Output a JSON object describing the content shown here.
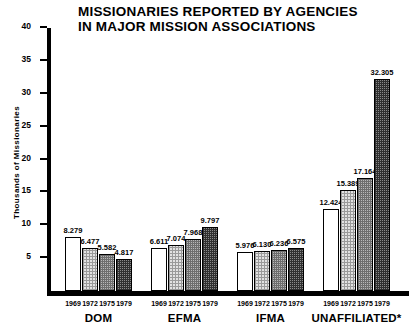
{
  "chart_data": {
    "type": "bar",
    "title": "MISSIONARIES REPORTED BY AGENCIES IN MAJOR MISSION ASSOCIATIONS",
    "title_line1": "MISSIONARIES REPORTED BY AGENCIES",
    "title_line2": "IN MAJOR MISSION ASSOCIATIONS",
    "xlabel": "",
    "ylabel": "Thousands of Missionaries",
    "ylim": [
      0,
      40
    ],
    "ytick_labels": [
      "40",
      "35",
      "30",
      "25",
      "20",
      "15",
      "10",
      "5"
    ],
    "ytick_values": [
      40,
      35,
      30,
      25,
      20,
      15,
      10,
      5
    ],
    "grid": false,
    "legend": "none",
    "categories": [
      "DOM",
      "EFMA",
      "IFMA",
      "UNAFFILIATED*"
    ],
    "x": [
      "1969",
      "1972",
      "1975",
      "1979"
    ],
    "series": [
      {
        "name": "1969",
        "fill": "white",
        "values": [
          8.279,
          6.611,
          5.976,
          12.424
        ]
      },
      {
        "name": "1972",
        "fill": "light",
        "values": [
          6.477,
          7.074,
          6.13,
          15.389
        ]
      },
      {
        "name": "1975",
        "fill": "medium",
        "values": [
          5.582,
          7.968,
          6.236,
          17.164
        ]
      },
      {
        "name": "1979",
        "fill": "dark",
        "values": [
          4.817,
          9.797,
          6.575,
          32.305
        ]
      }
    ],
    "groups": [
      {
        "label": "DOM",
        "bars": [
          {
            "year": "1969",
            "value": 8.279,
            "value_label": "8.279",
            "fill": "white"
          },
          {
            "year": "1972",
            "value": 6.477,
            "value_label": "6.477",
            "fill": "light"
          },
          {
            "year": "1975",
            "value": 5.582,
            "value_label": "5.582",
            "fill": "medium"
          },
          {
            "year": "1979",
            "value": 4.817,
            "value_label": "4.817",
            "fill": "dark"
          }
        ]
      },
      {
        "label": "EFMA",
        "bars": [
          {
            "year": "1969",
            "value": 6.611,
            "value_label": "6.611",
            "fill": "white"
          },
          {
            "year": "1972",
            "value": 7.074,
            "value_label": "7.074",
            "fill": "light"
          },
          {
            "year": "1975",
            "value": 7.968,
            "value_label": "7.968",
            "fill": "medium"
          },
          {
            "year": "1979",
            "value": 9.797,
            "value_label": "9.797",
            "fill": "dark"
          }
        ]
      },
      {
        "label": "IFMA",
        "bars": [
          {
            "year": "1969",
            "value": 5.976,
            "value_label": "5.976",
            "fill": "white"
          },
          {
            "year": "1972",
            "value": 6.13,
            "value_label": "6.130",
            "fill": "light"
          },
          {
            "year": "1975",
            "value": 6.236,
            "value_label": "6.236",
            "fill": "medium"
          },
          {
            "year": "1979",
            "value": 6.575,
            "value_label": "6.575",
            "fill": "dark"
          }
        ]
      },
      {
        "label": "UNAFFILIATED*",
        "bars": [
          {
            "year": "1969",
            "value": 12.424,
            "value_label": "12.424",
            "fill": "white"
          },
          {
            "year": "1972",
            "value": 15.389,
            "value_label": "15.389",
            "fill": "light"
          },
          {
            "year": "1975",
            "value": 17.164,
            "value_label": "17.164",
            "fill": "medium"
          },
          {
            "year": "1979",
            "value": 32.305,
            "value_label": "32.305",
            "fill": "dark"
          }
        ]
      }
    ],
    "colors": {
      "axis": "#000000",
      "text": "#000000",
      "background": "#ffffff",
      "fill_white": "#ffffff",
      "fill_light": "#e2e2e2",
      "fill_medium": "#b8b8b8",
      "fill_dark": "#8a8a8a"
    }
  }
}
